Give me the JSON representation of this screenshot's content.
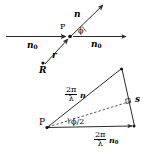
{
  "figure": {
    "stroke_color": "#2b2b2b",
    "background": "#ffffff",
    "upper_diagram": {
      "point_label": "P",
      "incident_left_label": "n",
      "incident_left_sub": "0",
      "incident_right_label": "n",
      "incident_right_sub": "0",
      "scattered_label": "n",
      "angle_label": "ϕ",
      "r_label": "r",
      "R_label": "R"
    },
    "lower_diagram": {
      "vertex_label": "P",
      "side_left_num": "2π",
      "side_left_den": "λ",
      "side_left_vector": "n",
      "side_bottom_num": "2π",
      "side_bottom_den": "λ",
      "side_bottom_vector": "n",
      "side_bottom_sub": "0",
      "side_right_label": "s",
      "angle_label": "ϕ/2",
      "right_angle_marker": "∟"
    }
  }
}
